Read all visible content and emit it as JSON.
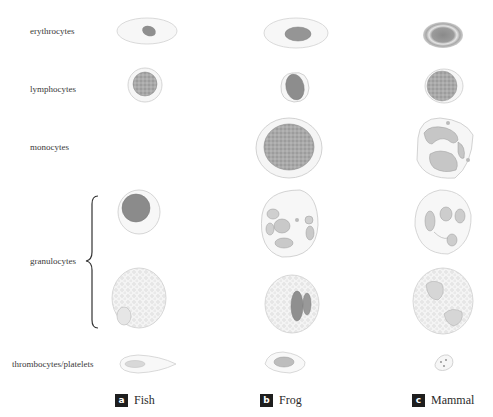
{
  "rows": [
    {
      "label": "erythrocytes"
    },
    {
      "label": "lymphocytes"
    },
    {
      "label": "monocytes"
    },
    {
      "label": "granulocytes"
    },
    {
      "label": "thrombocytes/platelets"
    }
  ],
  "columns": [
    {
      "badge": "a",
      "label": "Fish"
    },
    {
      "badge": "b",
      "label": "Frog"
    },
    {
      "badge": "c",
      "label": "Mammal"
    }
  ],
  "colors": {
    "cell_outline": "#c8c8c8",
    "cytoplasm": "#f6f6f6",
    "nucleus": "#8f8f8f",
    "nucleus_light": "#b5b5b5",
    "badge_bg": "#1e1e1e"
  }
}
